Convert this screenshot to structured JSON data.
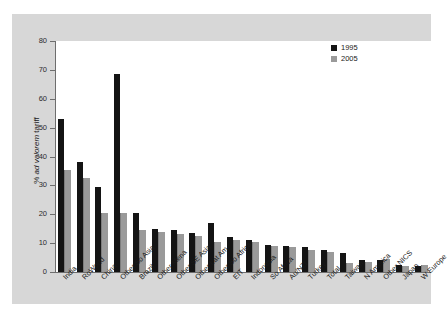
{
  "chart_data": {
    "type": "bar",
    "title": "",
    "subtitle": "",
    "xlabel": "",
    "ylabel": "% ad valorem tariff",
    "ylabel_plain": "%",
    "ylabel_italic": "ad valorem",
    "ylabel_tail": "tariff",
    "ylim": [
      0,
      80
    ],
    "yticks": [
      0,
      10,
      20,
      30,
      40,
      50,
      60,
      70,
      80
    ],
    "grid": false,
    "legend_position": "top-right",
    "categories": [
      "India",
      "RoWorld",
      "China",
      "Other So Asia",
      "Brazil",
      "Other Mena",
      "Other SE Asia",
      "Other Lat Am",
      "Other So Africa",
      "EIT",
      "Indonesia",
      "So Africa",
      "Au/NZl",
      "Turkey",
      "Total",
      "Taiwan",
      "N America",
      "Other NICS",
      "Japan",
      "W Europe"
    ],
    "series": [
      {
        "name": "1995",
        "color": "#141414",
        "values": [
          53,
          38,
          29.5,
          68.5,
          20.5,
          15,
          14.5,
          13.5,
          17,
          12,
          11,
          9.5,
          9,
          8.5,
          7.5,
          6.5,
          4,
          4,
          2.5,
          2
        ]
      },
      {
        "name": "2005",
        "color": "#9a9a9a",
        "values": [
          35.5,
          32.5,
          20.5,
          20.5,
          14.5,
          14,
          13,
          12.5,
          10.5,
          11,
          10.5,
          9,
          8.5,
          7.5,
          7,
          3,
          3.5,
          4.5,
          2,
          2.5
        ]
      }
    ]
  },
  "legend": {
    "items": [
      {
        "label": "1995",
        "color": "#141414"
      },
      {
        "label": "2005",
        "color": "#9a9a9a"
      }
    ]
  }
}
